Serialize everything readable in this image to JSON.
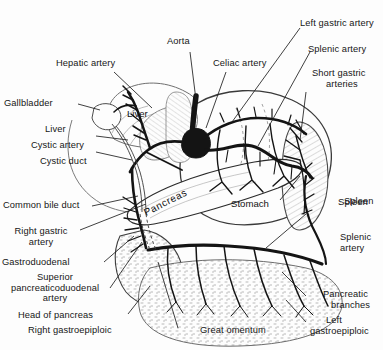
{
  "figure": {
    "background_color": "#fdfdfd",
    "ink_color": "#1a1a1a",
    "stipple_color": "#8d8d8d"
  },
  "organ_labels": [
    {
      "name": "liver",
      "text": "Liver"
    },
    {
      "name": "pancreas",
      "text": "Pancreas"
    },
    {
      "name": "stomach",
      "text": "Stomach"
    },
    {
      "name": "spleen",
      "text": "Spleen"
    }
  ],
  "callouts": {
    "hepatic_artery": "Hepatic artery",
    "aorta": "Aorta",
    "celiac_artery": "Celiac artery",
    "left_gastric_artery": "Left gastric artery",
    "splenic_artery_top": "Splenic artery",
    "short_gastric_arteries_l1": "Short gastric",
    "short_gastric_arteries_l2": "arteries",
    "gallbladder": "Gallbladder",
    "liver_left": "Liver",
    "cystic_artery": "Cystic artery",
    "cystic_duct": "Cystic duct",
    "common_bile_duct": "Common bile duct",
    "right_gastric_artery_l1": "Right gastric",
    "right_gastric_artery_l2": "artery",
    "gastroduodenal": "Gastroduodenal",
    "superior_pd_l1": "Superior",
    "superior_pd_l2": "pancreaticoduodenal",
    "superior_pd_l3": "artery",
    "head_of_pancreas": "Head of pancreas",
    "right_gastroepiploic": "Right gastroepiploic",
    "great_omentum": "Great omentum",
    "spleen": "Spleen",
    "splenic_artery_l1": "Splenic",
    "splenic_artery_l2": "artery",
    "pancreatic_branches_l1": "Pancreatic",
    "pancreatic_branches_l2": "branches",
    "left_gastroepiploic_l1": "Left",
    "left_gastroepiploic_l2": "gastroepiploic"
  }
}
